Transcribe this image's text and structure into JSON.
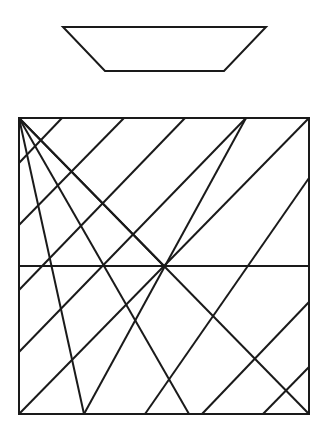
{
  "diagram": {
    "stroke": "#1a1a1a",
    "trapezoid": {
      "points": "63,27 266,27 224,71 105,71"
    },
    "square": {
      "x": 19,
      "y": 118,
      "w": 290,
      "h": 296
    },
    "midline": {
      "x1": 19,
      "y1": 266,
      "x2": 309,
      "y2": 266
    },
    "fan_lines": [
      {
        "x1": 19,
        "y1": 118,
        "x2": 84,
        "y2": 414
      },
      {
        "x1": 19,
        "y1": 118,
        "x2": 189,
        "y2": 414
      },
      {
        "x1": 19,
        "y1": 118,
        "x2": 309,
        "y2": 414
      },
      {
        "x1": 19,
        "y1": 118,
        "x2": 164,
        "y2": 266
      },
      {
        "x1": 84,
        "y1": 414,
        "x2": 246,
        "y2": 118
      }
    ],
    "parallel_lines": [
      {
        "x1": 19,
        "y1": 163,
        "x2": 62,
        "y2": 118
      },
      {
        "x1": 19,
        "y1": 225,
        "x2": 124,
        "y2": 118
      },
      {
        "x1": 19,
        "y1": 290,
        "x2": 185,
        "y2": 118
      },
      {
        "x1": 19,
        "y1": 352,
        "x2": 246,
        "y2": 118
      },
      {
        "x1": 19,
        "y1": 414,
        "x2": 309,
        "y2": 118
      },
      {
        "x1": 145,
        "y1": 414,
        "x2": 309,
        "y2": 178
      },
      {
        "x1": 202,
        "y1": 414,
        "x2": 309,
        "y2": 302
      },
      {
        "x1": 263,
        "y1": 414,
        "x2": 309,
        "y2": 367
      }
    ]
  }
}
